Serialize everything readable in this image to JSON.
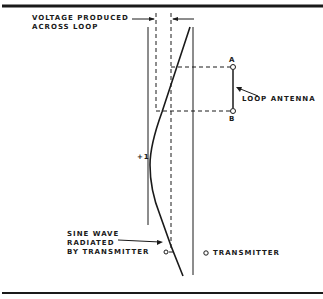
{
  "diagram": {
    "labels": {
      "voltage_line1": "VOLTAGE PRODUCED",
      "voltage_line2": "ACROSS LOOP",
      "point_a": "A",
      "point_b": "B",
      "loop_antenna": "LOOP ANTENNA",
      "plus_one": "+1",
      "sine_line1": "SINE WAVE",
      "sine_line2": "RADIATED",
      "sine_line3": "BY TRANSMITTER",
      "transmitter": "TRANSMITTER"
    },
    "colors": {
      "ink": "#1a1a1a",
      "background": "#ffffff"
    }
  }
}
